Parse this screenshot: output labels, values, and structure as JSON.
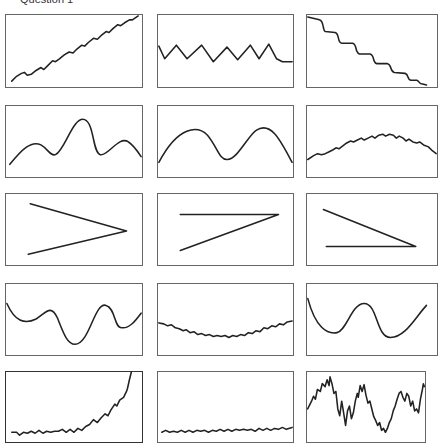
{
  "title": "Question 1",
  "grid": {
    "rows": 5,
    "cols": 3
  },
  "panels": [
    {
      "id": "r1c1",
      "row": 1,
      "col": 1,
      "description": "increasing linear trend with small periodic wiggles"
    },
    {
      "id": "r1c2",
      "row": 1,
      "col": 2,
      "description": "regular zigzag oscillation around constant level, flattening at end"
    },
    {
      "id": "r1c3",
      "row": 1,
      "col": 3,
      "description": "decreasing staircase-like trend with wiggles"
    },
    {
      "id": "r2c1",
      "row": 2,
      "col": 1,
      "description": "smooth curve with three peaks, highest in middle"
    },
    {
      "id": "r2c2",
      "row": 2,
      "col": 2,
      "description": "smooth two-hump curve"
    },
    {
      "id": "r2c3",
      "row": 2,
      "col": 3,
      "description": "shallow arch with small high-frequency wiggles"
    },
    {
      "id": "r3c1",
      "row": 3,
      "col": 1,
      "description": "two straight lines converging to the right (> shape)"
    },
    {
      "id": "r3c2",
      "row": 3,
      "col": 2,
      "description": "horizontal top line and diagonal meeting at upper right (Z shape)"
    },
    {
      "id": "r3c3",
      "row": 3,
      "col": 3,
      "description": "diagonal down and horizontal bottom line meeting at lower right"
    },
    {
      "id": "r4c1",
      "row": 4,
      "col": 1,
      "description": "smooth wave with deep trough in middle"
    },
    {
      "id": "r4c2",
      "row": 4,
      "col": 2,
      "description": "shallow U-shaped curve with small wiggles"
    },
    {
      "id": "r4c3",
      "row": 4,
      "col": 3,
      "description": "smooth W-shaped curve with one central peak"
    },
    {
      "id": "r5c1",
      "row": 5,
      "col": 1,
      "description": "flat noisy line rising exponentially at the end"
    },
    {
      "id": "r5c2",
      "row": 5,
      "col": 2,
      "description": "flat line with small regular wiggles near bottom"
    },
    {
      "id": "r5c3",
      "row": 5,
      "col": 3,
      "description": "highly irregular noisy random-walk signal"
    }
  ]
}
